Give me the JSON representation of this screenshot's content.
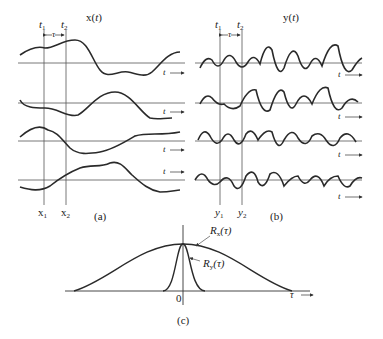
{
  "panel_a": {
    "title_fn": "x",
    "title_arg": "t",
    "t1": "t",
    "t1_sub": "1",
    "t2": "t",
    "t2_sub": "2",
    "tau": "τ",
    "axis_label": "t",
    "x1": "x",
    "x1_sub": "1",
    "x2": "x",
    "x2_sub": "2",
    "caption": "(a)"
  },
  "panel_b": {
    "title_fn": "y",
    "title_arg": "t",
    "t1": "t",
    "t1_sub": "1",
    "t2": "t",
    "t2_sub": "2",
    "tau": "τ",
    "axis_label": "t",
    "y1": "y",
    "y1_sub": "1",
    "y2": "y",
    "y2_sub": "2",
    "caption": "(b)"
  },
  "panel_c": {
    "rx_label": "R",
    "rx_sub": "x",
    "rx_arg": "(τ)",
    "ry_label": "R",
    "ry_sub": "y",
    "ry_arg": "(τ)",
    "origin": "0",
    "axis_label": "τ",
    "caption": "(c)"
  },
  "colors": {
    "line": "#2a2a2a",
    "axis": "#555555",
    "background": "#ffffff"
  }
}
